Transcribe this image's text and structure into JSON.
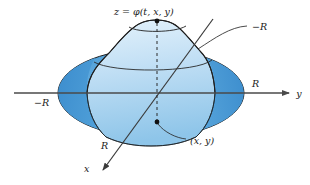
{
  "figure": {
    "type": "math-3d-diagram",
    "background_color": "#ffffff",
    "labels": {
      "surface": "z = φ(t, x, y)",
      "radius_neg_leader": "−R",
      "radius_left": "−R",
      "radius_right": "R",
      "radius_x": "R",
      "axis_y": "y",
      "axis_x": "x",
      "point": "(x, y)"
    },
    "colors": {
      "disk_dark": "#3d90d0",
      "disk_mid": "#62aade",
      "disk_light": "#9ccdee",
      "surface_top": "#dceefa",
      "surface_bottom": "#8fc6e9",
      "outline": "#1f1f1f",
      "axis": "#4a4a4a",
      "dot": "#111111"
    },
    "geometry": {
      "disk_center": [
        151,
        93
      ],
      "disk_radius_x": 93,
      "disk_radius_y": 44,
      "apex_point": [
        157,
        21
      ],
      "plane_point": [
        157,
        122
      ],
      "y_axis_arrow_tip": [
        296,
        93
      ],
      "x_axis_arrow_tip": [
        100,
        173
      ]
    }
  }
}
